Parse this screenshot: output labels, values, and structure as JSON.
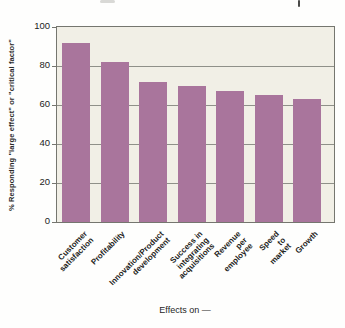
{
  "chart_data": {
    "type": "bar",
    "categories": [
      "Customer satisfaction",
      "Profitability",
      "Innovation/Product\ndevelopment",
      "Success in integrating\nacquisitions",
      "Revenue per employee",
      "Speed to market",
      "Growth"
    ],
    "values": [
      92,
      82,
      72,
      70,
      67,
      65,
      63
    ],
    "title": "",
    "xlabel": "Effects on —",
    "ylabel": "% Responding \"large effect\" or \"critical factor\"",
    "ylim": [
      0,
      100
    ],
    "yticks": [
      0,
      20,
      40,
      60,
      80,
      100
    ],
    "grid": true,
    "legend": "none",
    "bar_color": "#a9759c",
    "plot_bg": "#f1efe6",
    "grid_color": "#8f9089",
    "border_color": "#75766f"
  }
}
